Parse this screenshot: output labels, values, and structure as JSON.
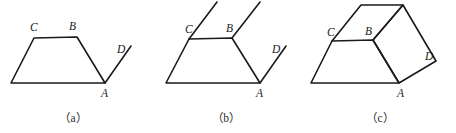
{
  "figure": {
    "stroke_color": "#1a1a1a",
    "background_color": "#ffffff",
    "label_color": "#1a1a1a",
    "caption_color": "#2b2b2b",
    "panels": [
      {
        "id": "panel-a",
        "caption": "（a）",
        "caption_x": 73,
        "caption_y": 122,
        "vertex_labels": [
          {
            "name": "C",
            "text": "C",
            "x": 30,
            "y": 31
          },
          {
            "name": "B",
            "text": "B",
            "x": 69,
            "y": 30
          },
          {
            "name": "D",
            "text": "D",
            "x": 117,
            "y": 53
          },
          {
            "name": "A",
            "text": "A",
            "x": 101,
            "y": 97
          }
        ],
        "paths": [
          {
            "name": "trapezoid-outline",
            "d": "M 11 83 L 34 38 L 77 37 L 105 83 Z"
          },
          {
            "name": "ray-AD",
            "d": "M 105 83 L 131 46"
          }
        ]
      },
      {
        "id": "panel-b",
        "caption": "（b）",
        "caption_x": 226,
        "caption_y": 122,
        "vertex_labels": [
          {
            "name": "C",
            "text": "C",
            "x": 185,
            "y": 33
          },
          {
            "name": "B",
            "text": "B",
            "x": 226,
            "y": 32
          },
          {
            "name": "D",
            "text": "D",
            "x": 272,
            "y": 53
          },
          {
            "name": "A",
            "text": "A",
            "x": 256,
            "y": 97
          }
        ],
        "paths": [
          {
            "name": "trapezoid-outline",
            "d": "M 166 83 L 189 39 L 232 38 L 260 83 Z"
          },
          {
            "name": "ray-AD",
            "d": "M 260 83 L 286 46"
          },
          {
            "name": "ray-from-C",
            "d": "M 189 39 L 217 2"
          },
          {
            "name": "ray-from-B",
            "d": "M 232 38 L 260 2"
          }
        ]
      },
      {
        "id": "panel-c",
        "caption": "（c）",
        "caption_x": 380,
        "caption_y": 122,
        "vertex_labels": [
          {
            "name": "C",
            "text": "C",
            "x": 327,
            "y": 36
          },
          {
            "name": "B",
            "text": "B",
            "x": 365,
            "y": 35
          },
          {
            "name": "D",
            "text": "D",
            "x": 425,
            "y": 60
          },
          {
            "name": "A",
            "text": "A",
            "x": 397,
            "y": 97
          }
        ],
        "paths": [
          {
            "name": "trapezoid-outline",
            "d": "M 311 83 L 332 41 L 373 40 L 399 83 Z"
          },
          {
            "name": "quad-upper-left",
            "d": "M 332 41 L 361 5 L 403 5 L 373 40"
          },
          {
            "name": "quad-right",
            "d": "M 373 40 L 403 5 L 436 61 L 399 83 Z"
          }
        ]
      }
    ]
  }
}
